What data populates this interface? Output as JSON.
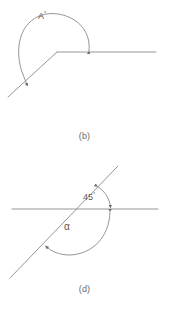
{
  "page": {
    "background_color": "#ffffff",
    "line_color": "#8a8a8a",
    "text_color": "#5a5a5a",
    "width": 169,
    "height": 309
  },
  "figures": [
    {
      "id": "figure-b",
      "caption": "(b)",
      "description": "reflex angle formed by a horizontal ray and a down-left diagonal ray meeting at a vertex",
      "angle_label": "A",
      "angle_degree_symbol": "°",
      "vertex": {
        "x": 57,
        "y": 52
      },
      "rays": [
        {
          "name": "horizontal-ray-right",
          "from": {
            "x": 57,
            "y": 52
          },
          "to": {
            "x": 156,
            "y": 52
          }
        },
        {
          "name": "diagonal-ray-lower-left",
          "from": {
            "x": 57,
            "y": 52
          },
          "to": {
            "x": 8,
            "y": 97
          }
        }
      ],
      "arc": {
        "name": "reflex-angle-arc",
        "arrowheads": [
          "start",
          "end"
        ],
        "sweep": "counterclockwise-over-top"
      }
    },
    {
      "id": "figure-d",
      "caption": "(d)",
      "description": "a horizontal line crossed by a diagonal line, with a 45 degree angle marked above right and angle alpha marked below",
      "intersection": {
        "x": 60,
        "y": 209
      },
      "lines": [
        {
          "name": "horizontal-line",
          "from": {
            "x": 12,
            "y": 209
          },
          "to": {
            "x": 158,
            "y": 209
          }
        },
        {
          "name": "diagonal-line",
          "from": {
            "x": 10,
            "y": 278
          },
          "to": {
            "x": 118,
            "y": 166
          }
        }
      ],
      "angles": [
        {
          "name": "angle-45",
          "label": "45",
          "degree_symbol": "°",
          "value": 45,
          "units": "degrees",
          "position": "upper-right",
          "arc_arrowheads": [
            "start",
            "end"
          ]
        },
        {
          "name": "angle-alpha",
          "label": "α",
          "value": null,
          "units": "degrees",
          "position": "lower-right-reflex",
          "arc_arrowheads": [
            "start",
            "end"
          ]
        }
      ]
    }
  ]
}
